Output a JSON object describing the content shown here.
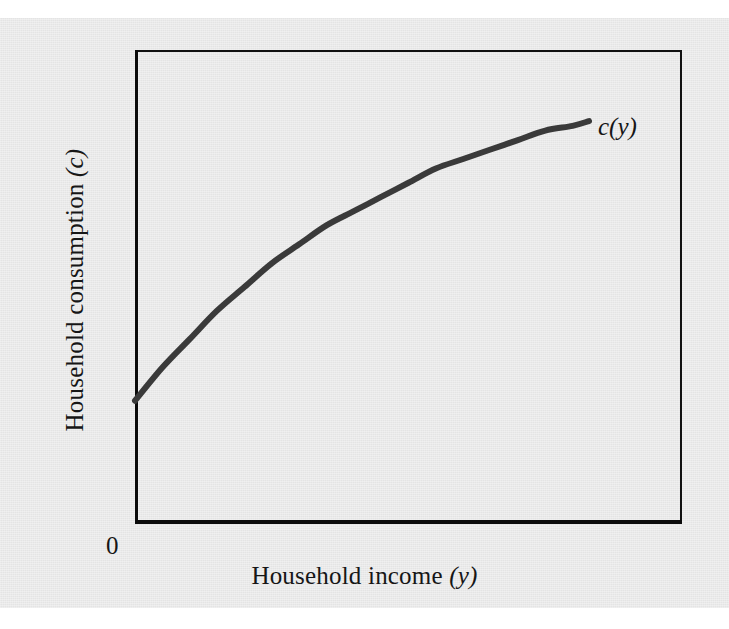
{
  "figure": {
    "background_color": "#e4e4e4",
    "page_color": "#ffffff",
    "axis_color": "#0b0b0b",
    "curve_color": "#3a3a3a"
  },
  "labels": {
    "x_axis_main": "Household income",
    "x_axis_variable": "(y)",
    "y_axis_main": "Household consumption",
    "y_axis_variable": "(c)",
    "origin": "0",
    "curve": "c(y)"
  },
  "chart_data": {
    "type": "line",
    "title": "",
    "xlabel": "Household income (y)",
    "ylabel": "Household consumption (c)",
    "xlim": [
      0,
      100
    ],
    "ylim": [
      0,
      100
    ],
    "grid": false,
    "legend": null,
    "annotations": [
      {
        "text": "c(y)",
        "x": 85,
        "y": 83,
        "style": "italic",
        "placement": "right-of-curve-end"
      },
      {
        "text": "0",
        "x": 0,
        "y": 0,
        "placement": "below-left-of-origin"
      }
    ],
    "axes_style": {
      "box": true,
      "emphasized_spines": [
        "left",
        "bottom"
      ],
      "ticks": [],
      "tick_labels": []
    },
    "series": [
      {
        "name": "c(y)",
        "color": "#3a3a3a",
        "linewidth": 6,
        "description": "Concave increasing consumption function with positive intercept and diminishing marginal propensity to consume",
        "x": [
          0,
          5,
          10,
          15,
          20,
          25,
          30,
          35,
          40,
          45,
          50,
          55,
          60,
          65,
          70,
          75,
          80,
          83
        ],
        "y": [
          26,
          33,
          39,
          45,
          50,
          55,
          59,
          63,
          66,
          69,
          72,
          75,
          77,
          79,
          81,
          83,
          84,
          85
        ]
      }
    ]
  }
}
